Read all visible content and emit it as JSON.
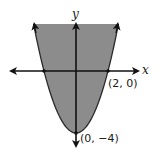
{
  "chart_data": {
    "type": "area",
    "title": "",
    "inequality": "y >= x^2 - 4",
    "boundary": {
      "equation": "y = x^2 - 4",
      "style": "solid"
    },
    "shaded_region": "inside (above) parabola",
    "xlabel": "x",
    "ylabel": "y",
    "labeled_points": [
      {
        "x": 2,
        "y": 0,
        "label": "(2, 0)"
      },
      {
        "x": 0,
        "y": -4,
        "label": "(0, −4)"
      }
    ],
    "xlim": [
      -4.2,
      3.9
    ],
    "ylim": [
      -4.8,
      3.1
    ],
    "grid": false,
    "legend": null
  },
  "colors": {
    "shade": "#8c8c8c",
    "axes": "#111111",
    "background": "#ffffff"
  },
  "labels": {
    "x_axis": "x",
    "y_axis": "y",
    "point_x_intercept": "(2, 0)",
    "point_vertex": "(0, −4)"
  }
}
